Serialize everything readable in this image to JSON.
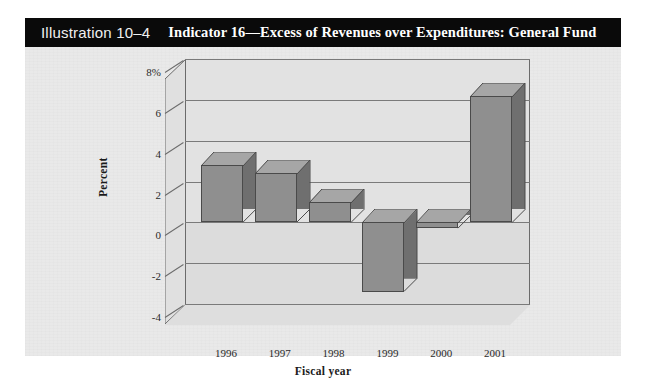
{
  "figure": {
    "illustration_number": "Illustration 10–4",
    "title": "Indicator 16—Excess of Revenues over Expenditures: General Fund"
  },
  "colors": {
    "title_bar_bg": "#0a0a0a",
    "title_bar_text": "#ffffff",
    "panel_bg": "#e9e9e9",
    "plot_bg": "#e2e2e2",
    "bar_face": "#8f8f8f",
    "bar_top": "#a6a6a6",
    "bar_side": "#6f6f6f",
    "gridline": "#7a7a7a"
  },
  "chart_data": {
    "type": "bar",
    "title": "Indicator 16—Excess of Revenues over Expenditures: General Fund",
    "subtitle": "Illustration 10–4",
    "xlabel": "Fiscal year",
    "ylabel": "Percent",
    "categories": [
      "1996",
      "1997",
      "1998",
      "1999",
      "2000",
      "2001"
    ],
    "values": [
      2.8,
      2.4,
      1.0,
      -3.4,
      -0.3,
      6.2
    ],
    "ylim": [
      -4,
      8
    ],
    "yticks": [
      8,
      6,
      4,
      2,
      0,
      -2,
      -4
    ],
    "ytick_labels": [
      "8%",
      "6",
      "4",
      "2",
      "0",
      "-2",
      "-4"
    ],
    "grid": true,
    "legend": false,
    "three_d": true
  }
}
